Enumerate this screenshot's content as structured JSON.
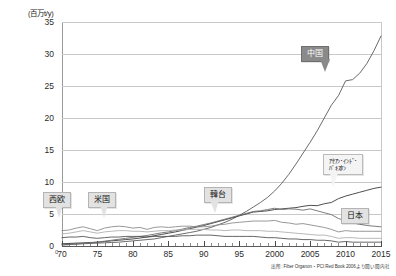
{
  "chart_data": {
    "type": "line",
    "title": "",
    "subtitle": "",
    "unit_label": "(百万t/y)",
    "xlabel": "",
    "ylabel": "",
    "ylim": [
      0,
      35
    ],
    "xlim": [
      1970,
      2015
    ],
    "grid": true,
    "legend_position": "inline-callouts",
    "yticks": [
      "0",
      "5",
      "10",
      "15",
      "20",
      "25",
      "30",
      "35"
    ],
    "ytick_values": [
      0,
      5,
      10,
      15,
      20,
      25,
      30,
      35
    ],
    "xticks": [
      "70",
      "75",
      "80",
      "85",
      "90",
      "95",
      "2000",
      "2005",
      "2010",
      "2015"
    ],
    "xtick_values": [
      1970,
      1975,
      1980,
      1985,
      1990,
      1995,
      2000,
      2005,
      2010,
      2015
    ],
    "x": [
      1970,
      1971,
      1972,
      1973,
      1974,
      1975,
      1976,
      1977,
      1978,
      1979,
      1980,
      1981,
      1982,
      1983,
      1984,
      1985,
      1986,
      1987,
      1988,
      1989,
      1990,
      1991,
      1992,
      1993,
      1994,
      1995,
      1996,
      1997,
      1998,
      1999,
      2000,
      2001,
      2002,
      2003,
      2004,
      2005,
      2006,
      2007,
      2008,
      2009,
      2010,
      2011,
      2012,
      2013,
      2014,
      2015
    ],
    "source_note": "出所: Fiber Organon・PCI Red Book 2006より聞い聞内社",
    "series": [
      {
        "name": "中国",
        "label": "中国",
        "color": "#5a5a5a",
        "values": [
          0.2,
          0.25,
          0.3,
          0.35,
          0.4,
          0.45,
          0.5,
          0.55,
          0.6,
          0.7,
          0.8,
          0.9,
          1.0,
          1.1,
          1.3,
          1.5,
          1.7,
          1.9,
          2.1,
          2.3,
          2.6,
          2.9,
          3.3,
          3.7,
          4.2,
          4.8,
          5.4,
          6.1,
          6.8,
          7.6,
          8.6,
          9.8,
          11.2,
          12.8,
          14.5,
          16.2,
          18.0,
          20.0,
          22.0,
          23.5,
          25.8,
          26.0,
          27.0,
          28.5,
          30.5,
          32.8
        ]
      },
      {
        "name": "アセアン・インド・パキスタン",
        "label": "アセアン・インド・\nパキスタン",
        "color": "#3a3a3a",
        "values": [
          0.35,
          0.4,
          0.45,
          0.5,
          0.55,
          0.6,
          0.7,
          0.8,
          0.9,
          1.0,
          1.1,
          1.25,
          1.4,
          1.6,
          1.8,
          2.0,
          2.2,
          2.45,
          2.7,
          2.95,
          3.2,
          3.5,
          3.8,
          4.1,
          4.4,
          4.7,
          5.0,
          5.3,
          5.4,
          5.5,
          5.7,
          5.8,
          5.9,
          6.0,
          6.2,
          6.35,
          6.3,
          6.6,
          6.8,
          7.4,
          7.8,
          8.1,
          8.4,
          8.7,
          9.0,
          9.2
        ]
      },
      {
        "name": "韓台",
        "label": "韓台",
        "color": "#6e6e6e",
        "values": [
          0.15,
          0.2,
          0.3,
          0.4,
          0.5,
          0.6,
          0.75,
          0.9,
          1.05,
          1.2,
          1.35,
          1.5,
          1.65,
          1.85,
          2.05,
          2.2,
          2.4,
          2.65,
          2.9,
          3.1,
          3.35,
          3.6,
          3.9,
          4.2,
          4.5,
          4.8,
          5.1,
          5.4,
          5.5,
          5.7,
          5.9,
          5.7,
          5.8,
          5.75,
          5.6,
          5.8,
          5.5,
          5.2,
          4.9,
          4.3,
          3.9,
          3.6,
          3.4,
          3.2,
          3.1,
          3.0
        ]
      },
      {
        "name": "米国",
        "label": "米国",
        "color": "#8c8c8c",
        "values": [
          2.4,
          2.5,
          2.8,
          3.0,
          2.7,
          2.4,
          2.8,
          3.0,
          3.1,
          3.0,
          2.8,
          2.9,
          2.6,
          2.9,
          3.0,
          2.9,
          3.0,
          3.1,
          3.1,
          3.0,
          3.0,
          3.1,
          3.3,
          3.4,
          3.6,
          3.7,
          3.8,
          3.9,
          3.9,
          3.9,
          4.0,
          3.7,
          3.6,
          3.4,
          3.5,
          3.3,
          3.1,
          2.9,
          2.6,
          2.2,
          2.4,
          2.3,
          2.3,
          2.3,
          2.3,
          2.3
        ]
      },
      {
        "name": "西欧",
        "label": "西欧",
        "color": "#b0b0b0",
        "values": [
          1.9,
          2.0,
          2.2,
          2.4,
          2.2,
          2.0,
          2.2,
          2.3,
          2.4,
          2.4,
          2.3,
          2.3,
          2.2,
          2.3,
          2.4,
          2.4,
          2.5,
          2.5,
          2.6,
          2.6,
          2.6,
          2.5,
          2.5,
          2.4,
          2.5,
          2.5,
          2.4,
          2.4,
          2.4,
          2.3,
          2.3,
          2.2,
          2.1,
          2.0,
          1.9,
          1.8,
          1.7,
          1.7,
          1.5,
          1.2,
          1.3,
          1.3,
          1.2,
          1.2,
          1.2,
          1.2
        ]
      },
      {
        "name": "日本",
        "label": "日本",
        "color": "#555555",
        "values": [
          1.3,
          1.4,
          1.4,
          1.5,
          1.3,
          1.2,
          1.3,
          1.4,
          1.4,
          1.5,
          1.5,
          1.5,
          1.4,
          1.5,
          1.5,
          1.5,
          1.5,
          1.6,
          1.6,
          1.7,
          1.7,
          1.7,
          1.6,
          1.5,
          1.5,
          1.5,
          1.5,
          1.5,
          1.4,
          1.3,
          1.3,
          1.2,
          1.1,
          1.1,
          1.0,
          1.0,
          0.9,
          0.9,
          0.8,
          0.6,
          0.7,
          0.6,
          0.6,
          0.6,
          0.6,
          0.6
        ]
      }
    ],
    "callouts": [
      {
        "name": "china",
        "label": "中国",
        "style": "dark"
      },
      {
        "name": "asean-india-pakistan",
        "label_line1": "ｱｾｱﾝ･ｲﾝﾄﾞ･",
        "label_line2": "ﾊﾟｷｽﾀﾝ",
        "style": "white"
      },
      {
        "name": "korea-taiwan",
        "label": "韓台",
        "style": "light"
      },
      {
        "name": "usa",
        "label": "米国",
        "style": "light"
      },
      {
        "name": "west-europe",
        "label": "西欧",
        "style": "light"
      },
      {
        "name": "japan",
        "label": "日本",
        "style": "light"
      }
    ]
  }
}
